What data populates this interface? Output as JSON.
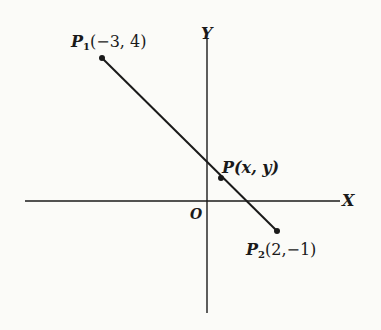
{
  "diagram": {
    "type": "coordinate-plane line segment",
    "axes": {
      "x_label": "X",
      "y_label": "Y",
      "origin_label": "O"
    },
    "points": {
      "p1": {
        "name": "P",
        "subscript": "1",
        "coords": "(−3, 4)",
        "x": -3,
        "y": 4
      },
      "p2": {
        "name": "P",
        "subscript": "2",
        "coords": "(2,−1)",
        "x": 2,
        "y": -1
      },
      "p": {
        "name": "P",
        "coords": "(x, y)"
      }
    },
    "colors": {
      "ink": "#1a1a1a",
      "paper": "#fbfbf8"
    }
  }
}
